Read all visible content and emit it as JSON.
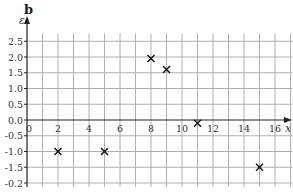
{
  "panel_label": "b",
  "chart_data": {
    "type": "scatter",
    "title": "",
    "xlabel": "x",
    "ylabel": "ε",
    "marker": "x",
    "x": [
      2,
      5,
      8,
      9,
      11,
      15
    ],
    "y": [
      -1.0,
      -1.0,
      1.95,
      1.6,
      -0.1,
      -1.5
    ],
    "xlim": [
      0,
      17
    ],
    "ylim": [
      -2.0,
      2.75
    ],
    "x_ticks": [
      0,
      2,
      4,
      6,
      8,
      10,
      12,
      14,
      16
    ],
    "x_tick_labels": [
      "0",
      "2",
      "4",
      "6",
      "8",
      "10",
      "12",
      "14",
      "16"
    ],
    "y_ticks": [
      2.5,
      2.0,
      1.5,
      1.0,
      0.5,
      0.0,
      -0.5,
      -1.0,
      -1.5,
      -2.0
    ],
    "y_tick_labels": [
      "2.5",
      "2.0",
      "1.5",
      "1.0",
      "0.5",
      "0.0",
      "-0.5",
      "-1.0",
      "-1.5",
      "-0.2"
    ],
    "grid": true,
    "grid_step_x": 1,
    "grid_step_y": 0.5,
    "legend": null,
    "colors": {
      "grid": "#b0b0b0",
      "axis": "#222222",
      "marker": "#111111",
      "text": "#333333"
    }
  }
}
